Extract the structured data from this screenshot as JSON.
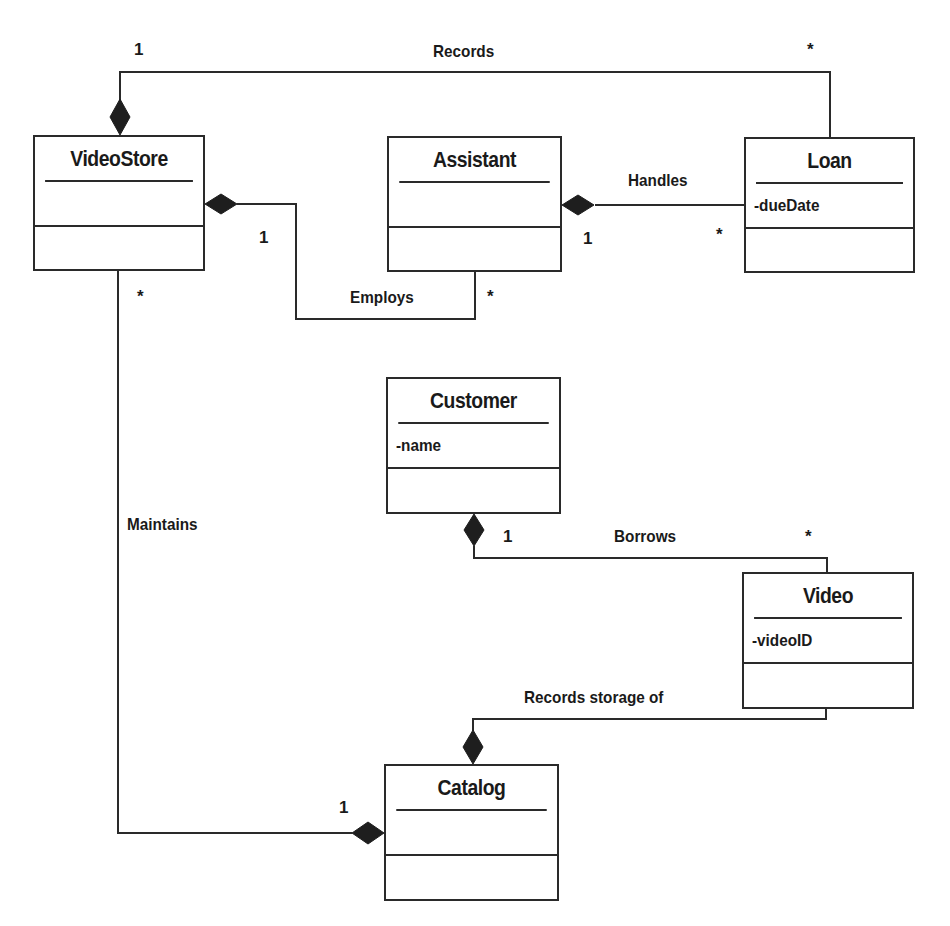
{
  "diagram": {
    "type": "UML class diagram",
    "classes": {
      "videostore": {
        "name": "VideoStore",
        "attributes": "",
        "operations": ""
      },
      "assistant": {
        "name": "Assistant",
        "attributes": "",
        "operations": ""
      },
      "loan": {
        "name": "Loan",
        "attributes": "-dueDate",
        "operations": ""
      },
      "customer": {
        "name": "Customer",
        "attributes": "-name",
        "operations": ""
      },
      "video": {
        "name": "Video",
        "attributes": "-videoID",
        "operations": ""
      },
      "catalog": {
        "name": "Catalog",
        "attributes": "",
        "operations": ""
      }
    },
    "associations": {
      "records": {
        "label": "Records",
        "from": "VideoStore",
        "to": "Loan",
        "from_mult": "1",
        "to_mult": "*",
        "kind": "composition"
      },
      "employs": {
        "label": "Employs",
        "from": "VideoStore",
        "to": "Assistant",
        "from_mult": "1",
        "to_mult": "*",
        "kind": "composition"
      },
      "handles": {
        "label": "Handles",
        "from": "Assistant",
        "to": "Loan",
        "from_mult": "1",
        "to_mult": "*",
        "kind": "composition"
      },
      "maintains": {
        "label": "Maintains",
        "from": "Catalog",
        "to": "VideoStore",
        "from_mult": "1",
        "to_mult": "*",
        "kind": "composition"
      },
      "borrows": {
        "label": "Borrows",
        "from": "Customer",
        "to": "Video",
        "from_mult": "1",
        "to_mult": "*",
        "kind": "composition"
      },
      "records_storage": {
        "label": "Records storage of",
        "from": "Catalog",
        "to": "Video",
        "from_mult": "",
        "to_mult": "",
        "kind": "composition"
      }
    },
    "colors": {
      "line": "#2a2a2a",
      "background": "#ffffff",
      "text": "#1a1a1a"
    }
  }
}
